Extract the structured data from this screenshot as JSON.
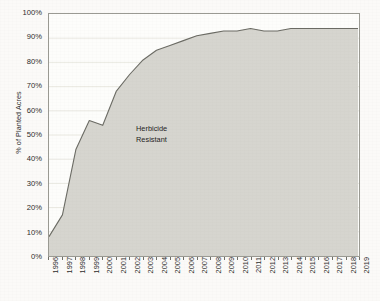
{
  "chart_data": {
    "type": "area",
    "title": "",
    "xlabel": "",
    "ylabel": "% of Planted Acres",
    "ylim": [
      0,
      100
    ],
    "xlim": [
      1996,
      2019
    ],
    "grid": true,
    "legend_position": "none",
    "annotations": [
      {
        "text_line1": "Herbicide",
        "text_line2": "Resistant",
        "x": 2004,
        "y": 50
      }
    ],
    "y_ticks": [
      "0%",
      "10%",
      "20%",
      "30%",
      "40%",
      "50%",
      "60%",
      "70%",
      "80%",
      "90%",
      "100%"
    ],
    "y_tick_values": [
      0,
      10,
      20,
      30,
      40,
      50,
      60,
      70,
      80,
      90,
      100
    ],
    "categories": [
      "1996",
      "1997",
      "1998",
      "1999",
      "2000",
      "2001",
      "2002",
      "2003",
      "2004",
      "2005",
      "2006",
      "2007",
      "2008",
      "2009",
      "2010",
      "2011",
      "2012",
      "2013",
      "2014",
      "2015",
      "2016",
      "2017",
      "2018",
      "2019"
    ],
    "series": [
      {
        "name": "Herbicide Resistant",
        "values": [
          8,
          17,
          44,
          56,
          54,
          68,
          75,
          81,
          85,
          87,
          89,
          91,
          92,
          93,
          93,
          94,
          93,
          93,
          94,
          94,
          94,
          94,
          94,
          94
        ],
        "fill_color": "#d6d5cf",
        "line_color": "#6b6b64"
      }
    ],
    "colors": {
      "plot_background": "#fdfdfb",
      "page_background": "#fbfaf8",
      "axis": "#9a9a93",
      "gridline": "#e4e3dc",
      "text": "#2b2b2b",
      "area_fill": "#d6d5cf",
      "area_line": "#6b6b64"
    }
  }
}
